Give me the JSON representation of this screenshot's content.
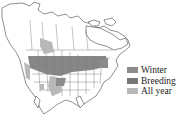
{
  "map": {
    "region": "North America",
    "colors": {
      "land": "#ffffff",
      "border": "#444444",
      "winter": "#8c8c8c",
      "breeding": "#777777",
      "all_year": "#b8b8b8"
    }
  },
  "legend": {
    "items": [
      {
        "label": "Winter",
        "color": "#8c8c8c"
      },
      {
        "label": "Breeding",
        "color": "#777777"
      },
      {
        "label": "All year",
        "color": "#b8b8b8"
      }
    ]
  }
}
